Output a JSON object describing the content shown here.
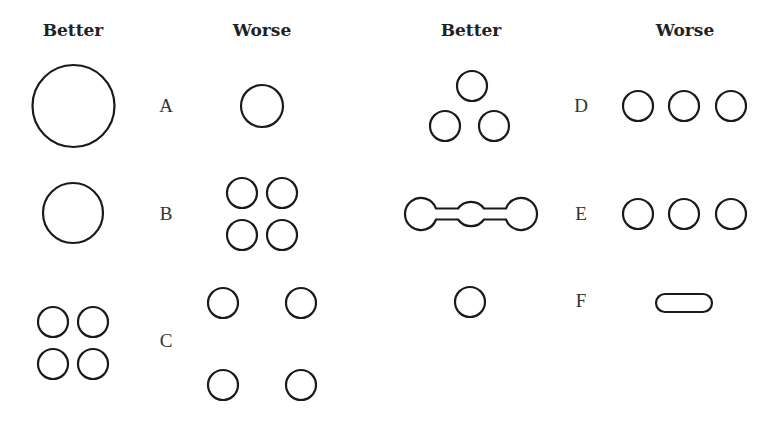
{
  "headers": {
    "left_better": "Better",
    "left_worse": "Worse",
    "right_better": "Better",
    "right_worse": "Worse"
  },
  "rows": [
    {
      "label": "A",
      "better": "one large circle",
      "worse": "one small circle"
    },
    {
      "label": "B",
      "better": "one medium circle",
      "worse": "four small circles in 2x2 grid"
    },
    {
      "label": "C",
      "better": "four small circles close together",
      "worse": "four small circles spread apart"
    },
    {
      "label": "D",
      "better": "three circles in triangle",
      "worse": "three circles in a row"
    },
    {
      "label": "E",
      "better": "three circles connected by bars",
      "worse": "three separate circles in a row"
    },
    {
      "label": "F",
      "better": "one small circle",
      "worse": "elongated pill shape"
    }
  ],
  "style": {
    "stroke": "#1a1a1a",
    "background": "#ffffff"
  }
}
